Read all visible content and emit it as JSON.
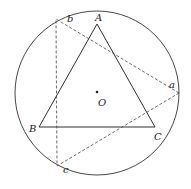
{
  "diagram": {
    "colors": {
      "stroke": "#333333",
      "background": "#ffffff"
    },
    "circle": {
      "cx": 97,
      "cy": 93,
      "r": 82
    },
    "center": {
      "label": "O",
      "x": 97,
      "y": 92
    },
    "triangle_solid": {
      "vertices": [
        {
          "label": "A",
          "x": 97,
          "y": 24
        },
        {
          "label": "B",
          "x": 39,
          "y": 127
        },
        {
          "label": "C",
          "x": 155,
          "y": 127
        }
      ]
    },
    "triangle_dashed": {
      "vertices": [
        {
          "label": "a",
          "x": 179,
          "y": 93
        },
        {
          "label": "b",
          "x": 56,
          "y": 19
        },
        {
          "label": "c",
          "x": 57,
          "y": 166
        }
      ]
    },
    "labels": {
      "A": "A",
      "B": "B",
      "C": "C",
      "O": "O",
      "a": "a",
      "b": "b",
      "c": "c"
    }
  }
}
